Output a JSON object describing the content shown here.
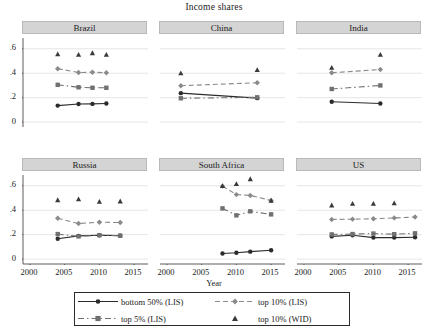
{
  "chart_data": {
    "type": "line",
    "title": "Income shares",
    "xlabel": "Year",
    "ylabel": "",
    "xlim": [
      1999,
      2017
    ],
    "ylim": [
      -0.04,
      0.68
    ],
    "xticks": [
      2000,
      2005,
      2010,
      2015
    ],
    "xticklabels": [
      "2000",
      "2005",
      "2010",
      "2015"
    ],
    "yticks": [
      0,
      0.2,
      0.4,
      0.6
    ],
    "yticklabels": [
      "0",
      ".2",
      ".4",
      ".6"
    ],
    "grid": "horizontal",
    "legend_position": "bottom",
    "layout": "small-multiples 2 rows x 3 columns",
    "series_styles": [
      {
        "name": "bottom 50% (LIS)",
        "line": "solid",
        "marker": "circle",
        "color": "#2b2b2b"
      },
      {
        "name": "top 5% (LIS)",
        "line": "dash-dot",
        "marker": "square",
        "color": "#707070"
      },
      {
        "name": "top 10% (LIS)",
        "line": "dashed",
        "marker": "diamond",
        "color": "#8a8a8a"
      },
      {
        "name": "top 10% (WID)",
        "line": "none",
        "marker": "triangle",
        "color": "#3a3a3a"
      }
    ],
    "panels": [
      {
        "title": "Brazil",
        "series": [
          {
            "name": "bottom 50% (LIS)",
            "x": [
              2004,
              2007,
              2009,
              2011
            ],
            "values": [
              0.135,
              0.148,
              0.149,
              0.152
            ]
          },
          {
            "name": "top 5% (LIS)",
            "x": [
              2004,
              2007,
              2009,
              2011
            ],
            "values": [
              0.305,
              0.285,
              0.281,
              0.281
            ]
          },
          {
            "name": "top 10% (LIS)",
            "x": [
              2004,
              2007,
              2009,
              2011
            ],
            "values": [
              0.437,
              0.406,
              0.408,
              0.404
            ]
          },
          {
            "name": "top 10% (WID)",
            "x": [
              2004,
              2007,
              2009,
              2011
            ],
            "values": [
              0.557,
              0.552,
              0.566,
              0.553
            ]
          }
        ]
      },
      {
        "title": "China",
        "series": [
          {
            "name": "bottom 50% (LIS)",
            "x": [
              2002,
              2013
            ],
            "values": [
              0.237,
              0.196
            ]
          },
          {
            "name": "top 5% (LIS)",
            "x": [
              2002,
              2013
            ],
            "values": [
              0.195,
              0.203
            ]
          },
          {
            "name": "top 10% (LIS)",
            "x": [
              2002,
              2013
            ],
            "values": [
              0.298,
              0.322
            ]
          },
          {
            "name": "top 10% (WID)",
            "x": [
              2002,
              2013
            ],
            "values": [
              0.401,
              0.427
            ]
          }
        ]
      },
      {
        "title": "India",
        "series": [
          {
            "name": "bottom 50% (LIS)",
            "x": [
              2004,
              2011
            ],
            "values": [
              0.166,
              0.152
            ]
          },
          {
            "name": "top 5% (LIS)",
            "x": [
              2004,
              2011
            ],
            "values": [
              0.271,
              0.3
            ]
          },
          {
            "name": "top 10% (LIS)",
            "x": [
              2004,
              2011
            ],
            "values": [
              0.404,
              0.43
            ]
          },
          {
            "name": "top 10% (WID)",
            "x": [
              2004,
              2011
            ],
            "values": [
              0.447,
              0.553
            ]
          }
        ]
      },
      {
        "title": "Russia",
        "series": [
          {
            "name": "bottom 50% (LIS)",
            "x": [
              2004,
              2007,
              2010,
              2013
            ],
            "values": [
              0.167,
              0.19,
              0.195,
              0.192
            ]
          },
          {
            "name": "top 5% (LIS)",
            "x": [
              2004,
              2007,
              2010,
              2013
            ],
            "values": [
              0.205,
              0.186,
              0.196,
              0.192
            ]
          },
          {
            "name": "top 10% (LIS)",
            "x": [
              2004,
              2007,
              2010,
              2013
            ],
            "values": [
              0.334,
              0.291,
              0.302,
              0.299
            ]
          },
          {
            "name": "top 10% (WID)",
            "x": [
              2004,
              2007,
              2010,
              2013
            ],
            "values": [
              0.484,
              0.491,
              0.47,
              0.474
            ]
          }
        ]
      },
      {
        "title": "South Africa",
        "series": [
          {
            "name": "bottom 50% (LIS)",
            "x": [
              2008,
              2010,
              2012,
              2015
            ],
            "values": [
              0.046,
              0.052,
              0.061,
              0.072
            ]
          },
          {
            "name": "top 5% (LIS)",
            "x": [
              2008,
              2010,
              2012,
              2015
            ],
            "values": [
              0.415,
              0.358,
              0.391,
              0.366
            ]
          },
          {
            "name": "top 10% (LIS)",
            "x": [
              2008,
              2010,
              2012,
              2015
            ],
            "values": [
              0.597,
              0.528,
              0.521,
              0.48
            ]
          },
          {
            "name": "top 10% (WID)",
            "x": [
              2008,
              2010,
              2012,
              2015
            ],
            "values": [
              0.6,
              0.616,
              0.656,
              0.48
            ]
          }
        ]
      },
      {
        "title": "US",
        "series": [
          {
            "name": "bottom 50% (LIS)",
            "x": [
              2004,
              2007,
              2010,
              2013,
              2016
            ],
            "values": [
              0.186,
              0.195,
              0.176,
              0.176,
              0.179
            ]
          },
          {
            "name": "top 5% (LIS)",
            "x": [
              2004,
              2007,
              2010,
              2013,
              2016
            ],
            "values": [
              0.202,
              0.205,
              0.209,
              0.204,
              0.211
            ]
          },
          {
            "name": "top 10% (LIS)",
            "x": [
              2004,
              2007,
              2010,
              2013,
              2016
            ],
            "values": [
              0.324,
              0.327,
              0.33,
              0.337,
              0.344
            ]
          },
          {
            "name": "top 10% (WID)",
            "x": [
              2004,
              2007,
              2010,
              2013
            ],
            "values": [
              0.441,
              0.455,
              0.455,
              0.459
            ]
          }
        ]
      }
    ]
  },
  "legend": {
    "items": [
      {
        "label": "bottom 50% (LIS)"
      },
      {
        "label": "top 10% (LIS)"
      },
      {
        "label": "top 5% (LIS)"
      },
      {
        "label": "top 10% (WID)"
      }
    ]
  }
}
